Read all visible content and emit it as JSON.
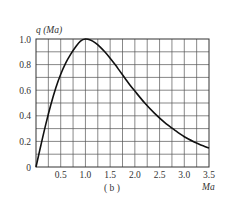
{
  "chart_data": {
    "type": "line",
    "title": "",
    "caption": "( b )",
    "xlabel": "Ma",
    "ylabel": "q (Ma)",
    "xlim": [
      0,
      3.5
    ],
    "ylim": [
      0,
      1.0
    ],
    "grid": true,
    "x_grid_step": 0.25,
    "y_grid_step": 0.1,
    "x_ticks": [
      "0.5",
      "1.0",
      "1.5",
      "2.0",
      "2.5",
      "3.0",
      "3.5"
    ],
    "x_tick_values": [
      0.5,
      1.0,
      1.5,
      2.0,
      2.5,
      3.0,
      3.5
    ],
    "y_ticks": [
      "0",
      "0.2",
      "0.4",
      "0.6",
      "0.8",
      "1.0"
    ],
    "y_tick_values": [
      0,
      0.2,
      0.4,
      0.6,
      0.8,
      1.0
    ],
    "series": [
      {
        "name": "q(Ma)",
        "x": [
          0,
          0.1,
          0.2,
          0.3,
          0.4,
          0.5,
          0.6,
          0.7,
          0.8,
          0.9,
          1.0,
          1.1,
          1.2,
          1.3,
          1.4,
          1.5,
          1.6,
          1.7,
          1.8,
          1.9,
          2.0,
          2.2,
          2.4,
          2.6,
          2.8,
          3.0,
          3.2,
          3.4,
          3.5
        ],
        "values": [
          0,
          0.172,
          0.337,
          0.487,
          0.618,
          0.725,
          0.812,
          0.88,
          0.938,
          0.984,
          1.0,
          0.992,
          0.97,
          0.937,
          0.896,
          0.85,
          0.8,
          0.747,
          0.694,
          0.641,
          0.593,
          0.5,
          0.419,
          0.349,
          0.29,
          0.236,
          0.196,
          0.163,
          0.149
        ]
      }
    ]
  }
}
